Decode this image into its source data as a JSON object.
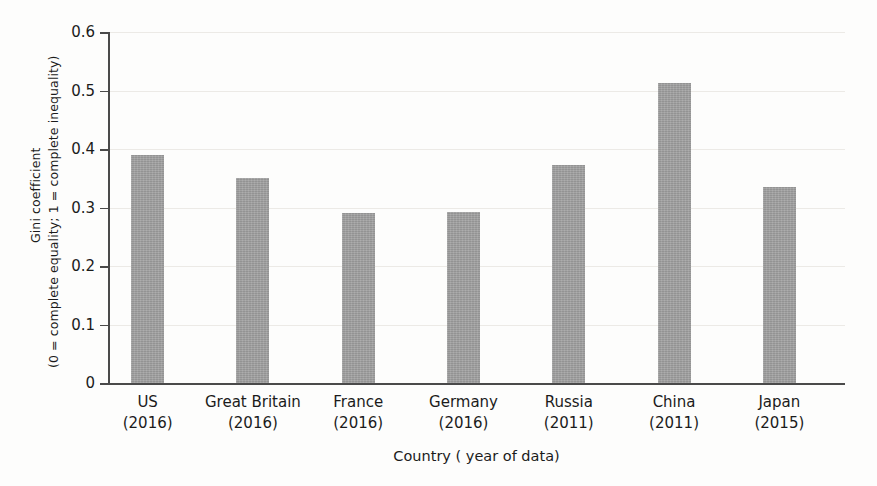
{
  "chart_data": {
    "type": "bar",
    "title": "",
    "xlabel": "Country ( year of data)",
    "ylabel_line1": "Gini coefficient",
    "ylabel_line2": "(0 = complete equality; 1 = complete inequality)",
    "categories": [
      "US",
      "Great Britain",
      "France",
      "Germany",
      "Russia",
      "China",
      "Japan"
    ],
    "category_years": [
      "(2016)",
      "(2016)",
      "(2016)",
      "(2016)",
      "(2011)",
      "(2011)",
      "(2015)"
    ],
    "values": [
      0.39,
      0.35,
      0.29,
      0.292,
      0.373,
      0.512,
      0.335
    ],
    "ylim": [
      0,
      0.6
    ],
    "ytick_values": [
      0,
      0.1,
      0.2,
      0.3,
      0.4,
      0.5,
      0.6
    ],
    "ytick_labels": [
      "0",
      "0.1",
      "0.2",
      "0.3",
      "0.4",
      "0.5",
      "0.6"
    ],
    "grid": true,
    "legend": "none",
    "bar_color": "#9d9d9d",
    "axis_color": "#4a4a4a",
    "grid_color": "#eceae6"
  }
}
